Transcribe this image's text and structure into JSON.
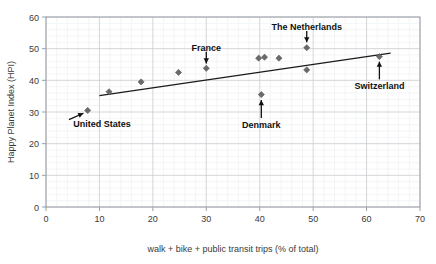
{
  "chart_data": {
    "type": "scatter",
    "title": "",
    "xlabel": "walk + bike + public transit trips (% of total)",
    "ylabel": "Happy Planet Index (HPI)",
    "xlim": [
      0,
      70
    ],
    "ylim": [
      0,
      60
    ],
    "xticks": [
      0,
      10,
      20,
      30,
      40,
      50,
      60,
      70
    ],
    "yticks": [
      0,
      10,
      20,
      30,
      40,
      50,
      60
    ],
    "xtick_labels": [
      "0",
      "10",
      "20",
      "30",
      "40",
      "50",
      "60",
      "70"
    ],
    "ytick_labels": [
      "0",
      "10",
      "20",
      "30",
      "40",
      "50",
      "60"
    ],
    "grid": true,
    "legend": "none",
    "marker": "diamond",
    "marker_color": "#6b6b6b",
    "trendline_color": "#1a1a1a",
    "points": [
      {
        "x": 7.8,
        "y": 30.5,
        "label": "United States"
      },
      {
        "x": 11.8,
        "y": 36.4,
        "label": ""
      },
      {
        "x": 17.8,
        "y": 39.5,
        "label": ""
      },
      {
        "x": 24.8,
        "y": 42.5,
        "label": ""
      },
      {
        "x": 30.0,
        "y": 43.8,
        "label": "France"
      },
      {
        "x": 39.8,
        "y": 47.0,
        "label": ""
      },
      {
        "x": 40.9,
        "y": 47.3,
        "label": ""
      },
      {
        "x": 43.6,
        "y": 47.0,
        "label": ""
      },
      {
        "x": 40.3,
        "y": 35.5,
        "label": "Denmark"
      },
      {
        "x": 48.8,
        "y": 50.3,
        "label": "The Netherlands"
      },
      {
        "x": 48.8,
        "y": 43.3,
        "label": ""
      },
      {
        "x": 62.4,
        "y": 47.5,
        "label": "Switzerland"
      }
    ],
    "trendline": {
      "x0": 10.0,
      "y0": 35.2,
      "x1": 64.5,
      "y1": 48.6
    },
    "annotations": [
      {
        "text": "United States",
        "text_x": 10.5,
        "text_y": 26.3,
        "arrow_from_x": 4.3,
        "arrow_from_y": 27.6,
        "arrow_to_x": 7.0,
        "arrow_to_y": 29.6,
        "dir": "up-right"
      },
      {
        "text": "France",
        "text_x": 30.0,
        "text_y": 50.4,
        "arrow_from_x": 30.0,
        "arrow_from_y": 49.0,
        "arrow_to_x": 30.0,
        "arrow_to_y": 45.3,
        "dir": "down"
      },
      {
        "text": "The Netherlands",
        "text_x": 48.8,
        "text_y": 57.0,
        "arrow_from_x": 48.8,
        "arrow_from_y": 55.6,
        "arrow_to_x": 48.8,
        "arrow_to_y": 52.0,
        "dir": "down"
      },
      {
        "text": "Denmark",
        "text_x": 40.3,
        "text_y": 26.0,
        "arrow_from_x": 40.3,
        "arrow_from_y": 28.1,
        "arrow_to_x": 40.3,
        "arrow_to_y": 33.8,
        "dir": "up"
      },
      {
        "text": "Switzerland",
        "text_x": 62.4,
        "text_y": 38.3,
        "arrow_from_x": 62.4,
        "arrow_from_y": 40.3,
        "arrow_to_x": 62.4,
        "arrow_to_y": 45.9,
        "dir": "up"
      }
    ]
  }
}
